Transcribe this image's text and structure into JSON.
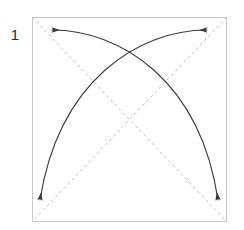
{
  "diagram": {
    "step_number": "1",
    "title": "",
    "figure_type": "origami-fold-step",
    "paper": {
      "shape": "square",
      "x": 32,
      "y": 17,
      "width": 195,
      "height": 205,
      "border_color": "#c9c9c9",
      "fill_color": "#ffffff",
      "border_width": 1
    },
    "crease_lines": [
      {
        "name": "diagonal-crease-tl-br",
        "style": "dashed",
        "color": "#bdbdbd",
        "dash": "3,3",
        "from_x": 32,
        "from_y": 17,
        "to_x": 227,
        "to_y": 222
      },
      {
        "name": "diagonal-crease-tr-bl",
        "style": "dashed",
        "color": "#bdbdbd",
        "dash": "3,3",
        "from_x": 227,
        "from_y": 17,
        "to_x": 32,
        "to_y": 222
      }
    ],
    "fold_arrows": [
      {
        "name": "arrow-top-left",
        "direction": "left",
        "color": "#3a3a3a",
        "tip_x": 52,
        "tip_y": 30,
        "tail_x": 218,
        "tail_y": 205,
        "description": "arc from bottom-right region sweeping up to top-left, arrowhead pointing left"
      },
      {
        "name": "arrow-top-right",
        "direction": "right",
        "color": "#3a3a3a",
        "tip_x": 207,
        "tip_y": 30,
        "tail_x": 40,
        "tail_y": 205,
        "description": "arc from bottom-left region sweeping up to top-right, arrowhead pointing right"
      },
      {
        "name": "arrow-bottom-left",
        "direction": "down",
        "color": "#3a3a3a",
        "tip_x": 40,
        "tip_y": 205,
        "description": "arrowhead pointing down at lower-left corner"
      },
      {
        "name": "arrow-bottom-right",
        "direction": "down",
        "color": "#3a3a3a",
        "tip_x": 218,
        "tip_y": 205,
        "description": "arrowhead pointing down at lower-right corner"
      }
    ],
    "arc_crossing_point": {
      "x": 130,
      "y": 45
    },
    "crease_crossing_point": {
      "x": 130,
      "y": 120
    }
  }
}
